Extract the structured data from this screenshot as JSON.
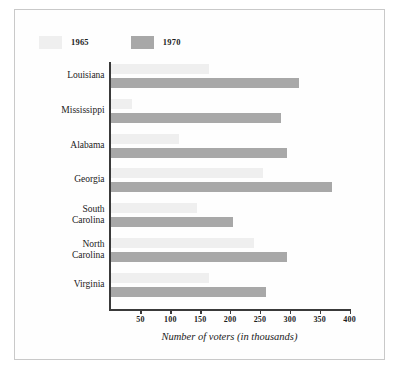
{
  "chart_data": {
    "type": "bar",
    "orientation": "horizontal",
    "title": "",
    "xlabel": "Number of voters (in thousands)",
    "ylabel": "",
    "xlim": [
      0,
      400
    ],
    "xticks": [
      50,
      100,
      150,
      200,
      250,
      300,
      350,
      400
    ],
    "grid": false,
    "legend_position": "top-left",
    "categories": [
      "Louisiana",
      "Mississippi",
      "Alabama",
      "Georgia",
      "South Carolina",
      "North Carolina",
      "Virginia"
    ],
    "category_lines": [
      [
        "Louisiana"
      ],
      [
        "Mississippi"
      ],
      [
        "Alabama"
      ],
      [
        "Georgia"
      ],
      [
        "South",
        "Carolina"
      ],
      [
        "North",
        "Carolina"
      ],
      [
        "Virginia"
      ]
    ],
    "series": [
      {
        "name": "1965",
        "color": "#efefef",
        "values": [
          165,
          35,
          115,
          255,
          145,
          240,
          165
        ]
      },
      {
        "name": "1970",
        "color": "#a8a8a8",
        "values": [
          315,
          285,
          295,
          370,
          205,
          295,
          260
        ]
      }
    ]
  },
  "legend": {
    "items": [
      {
        "label": "1965",
        "swatch_name": "legend-swatch-1965"
      },
      {
        "label": "1970",
        "swatch_name": "legend-swatch-1970"
      }
    ]
  },
  "axis": {
    "x_caption": "Number of voters (in thousands)",
    "tick_labels": [
      "50",
      "100",
      "150",
      "200",
      "250",
      "300",
      "350",
      "400"
    ]
  },
  "colors": {
    "bar_1965": "#efefef",
    "bar_1970": "#a8a8a8",
    "axis": "#3a3a3a",
    "frame": "#c9c9c9",
    "text": "#1d1d1d"
  }
}
